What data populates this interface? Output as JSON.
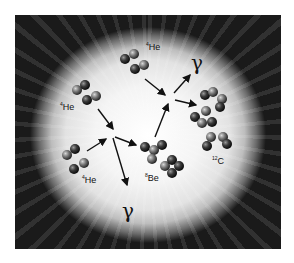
{
  "diagram": {
    "title_visible": false,
    "labels": {
      "he_top": {
        "mass": "4",
        "symbol": "He"
      },
      "he_left": {
        "mass": "4",
        "symbol": "He"
      },
      "he_bottom": {
        "mass": "4",
        "symbol": "He"
      },
      "be": {
        "mass": "8",
        "symbol": "Be"
      },
      "c": {
        "mass": "12",
        "symbol": "C"
      },
      "gamma_top": "γ",
      "gamma_bottom": "γ"
    },
    "colors": {
      "background": "#000000",
      "glow": "#ffffff",
      "nucleon": "#2a2a2a",
      "arrow": "#111111"
    }
  }
}
